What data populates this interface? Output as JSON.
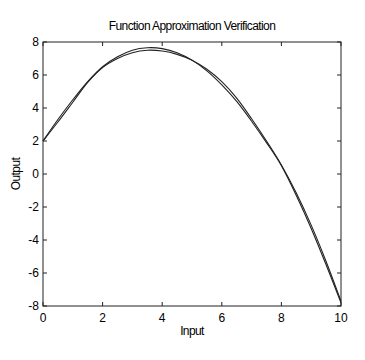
{
  "chart_data": {
    "type": "line",
    "title": "Function Approximation Verification",
    "xlabel": "Input",
    "ylabel": "Output",
    "xlim": [
      0,
      10
    ],
    "ylim": [
      -8,
      8
    ],
    "xticks": [
      0,
      2,
      4,
      6,
      8,
      10
    ],
    "yticks": [
      -8,
      -6,
      -4,
      -2,
      0,
      2,
      4,
      6,
      8
    ],
    "grid": false,
    "legend": null,
    "x": [
      0,
      0.5,
      1,
      1.5,
      2,
      2.5,
      3,
      3.5,
      4,
      4.5,
      5,
      5.5,
      6,
      6.5,
      7,
      7.5,
      8,
      8.5,
      9,
      9.5,
      10
    ],
    "series": [
      {
        "name": "Target function",
        "color": "#222222",
        "values": [
          2.0,
          3.3,
          4.5,
          5.6,
          6.5,
          7.1,
          7.5,
          7.65,
          7.6,
          7.35,
          6.9,
          6.25,
          5.4,
          4.4,
          3.2,
          1.9,
          0.5,
          -1.3,
          -3.3,
          -5.5,
          -7.8
        ]
      },
      {
        "name": "Network approximation",
        "color": "#222222",
        "values": [
          2.0,
          3.15,
          4.35,
          5.55,
          6.45,
          7.0,
          7.35,
          7.5,
          7.45,
          7.25,
          6.9,
          6.35,
          5.6,
          4.6,
          3.35,
          2.0,
          0.55,
          -1.15,
          -3.1,
          -5.3,
          -7.7
        ]
      }
    ]
  }
}
